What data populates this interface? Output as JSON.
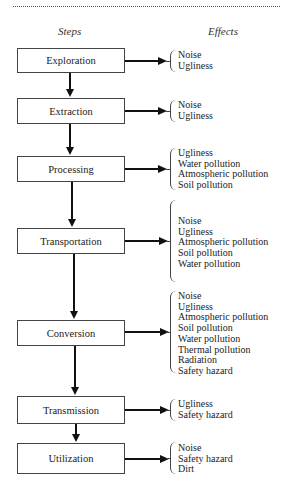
{
  "headers": {
    "steps": "Steps",
    "effects": "Effects"
  },
  "steps": [
    {
      "label": "Exploration",
      "effects": [
        "Noise",
        "Ugliness"
      ]
    },
    {
      "label": "Extraction",
      "effects": [
        "Noise",
        "Ugliness"
      ]
    },
    {
      "label": "Processing",
      "effects": [
        "Ugliness",
        "Water pollution",
        "Atmospheric pollution",
        "Soil pollution"
      ]
    },
    {
      "label": "Transportation",
      "effects": [
        "Noise",
        "Ugliness",
        "Atmospheric pollution",
        "Soil pollution",
        "Water pollution"
      ]
    },
    {
      "label": "Conversion",
      "effects": [
        "Noise",
        "Ugliness",
        "Atmospheric pollution",
        "Soil pollution",
        "Water pollution",
        "Thermal pollution",
        "Radiation",
        "Safety hazard"
      ]
    },
    {
      "label": "Transmission",
      "effects": [
        "Ugliness",
        "Safety hazard"
      ]
    },
    {
      "label": "Utilization",
      "effects": [
        "Noise",
        "Safety hazard",
        "Dirt"
      ]
    }
  ]
}
